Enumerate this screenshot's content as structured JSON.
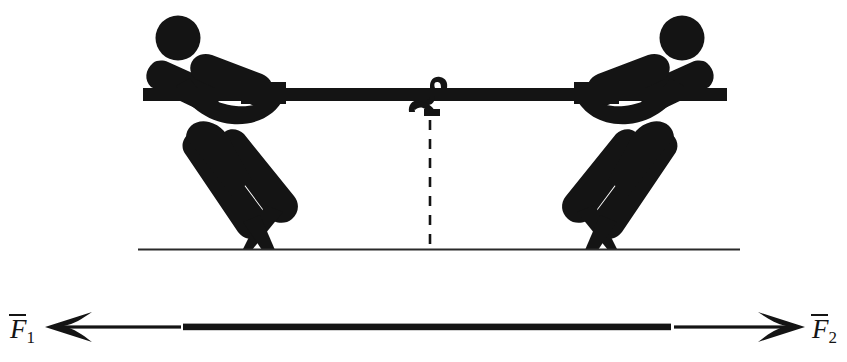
{
  "figure": {
    "background_color": "#ffffff",
    "ink_color": "#141414"
  },
  "labels": {
    "force_left": {
      "symbol": "F",
      "subscript": "1",
      "vector_bar": true,
      "full_text": "F̅1"
    },
    "force_right": {
      "symbol": "F",
      "subscript": "2",
      "vector_bar": true,
      "full_text": "F̅2"
    }
  },
  "scene": {
    "rope": {
      "name": "rope",
      "x_start": 143,
      "x_end": 727,
      "y": 95,
      "thickness": 13
    },
    "knot": {
      "name": "rope-knot",
      "x": 432,
      "y": 95
    },
    "midline": {
      "name": "dashed-midline",
      "x": 430,
      "y_start": 120,
      "y_end": 250,
      "style": "dashed"
    },
    "ground": {
      "name": "ground-line",
      "x_start": 138,
      "x_end": 740,
      "y": 249,
      "thickness": 2
    },
    "figures": [
      {
        "name": "puller-left",
        "facing": "right",
        "head_center_x": 178,
        "head_center_y": 38,
        "head_radius": 22
      },
      {
        "name": "puller-right",
        "facing": "left",
        "head_center_x": 682,
        "head_center_y": 38,
        "head_radius": 22
      }
    ]
  },
  "force_diagram": {
    "name": "force-axis",
    "y": 327,
    "left_arrow_tip_x": 45,
    "right_arrow_tip_x": 805,
    "thin_segment_left": [
      45,
      181
    ],
    "thick_segment": [
      183,
      671
    ],
    "thin_segment_right": [
      674,
      805
    ],
    "arrow_style": "barbed",
    "direction": "bidirectional"
  }
}
